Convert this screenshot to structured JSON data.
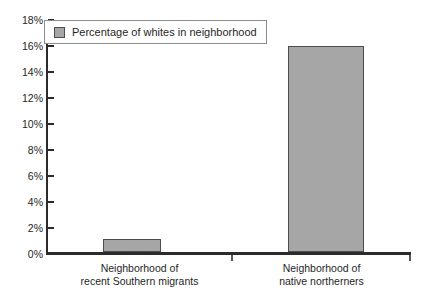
{
  "chart_data": {
    "type": "bar",
    "title": "",
    "subtitle": "",
    "xlabel": "",
    "ylabel": "",
    "categories": [
      "Neighborhood of recent Southern migrants",
      "Neighborhood of native northerners"
    ],
    "category_lines": [
      [
        "Neighborhood of",
        "recent Southern migrants"
      ],
      [
        "Neighborhood of",
        "native northerners"
      ]
    ],
    "series": [
      {
        "name": "Percentage of whites in neighborhood",
        "values": [
          1,
          16
        ]
      }
    ],
    "values": [
      1,
      16
    ],
    "ylim": [
      0,
      18
    ],
    "ytick_values": [
      18,
      16,
      14,
      12,
      10,
      8,
      6,
      4,
      2,
      0
    ],
    "ytick_labels": [
      "18%",
      "16%",
      "14%",
      "12%",
      "10%",
      "8%",
      "6%",
      "4%",
      "2%",
      "0%"
    ],
    "grid": false,
    "legend": {
      "position": "top-left-inside",
      "entries": [
        {
          "label": "Percentage of whites in neighborhood",
          "color": "#a6a6a6"
        }
      ]
    },
    "colors": {
      "bar_fill": "#a6a6a6",
      "bar_edge": "#4d4d4d",
      "axis": "#2b2b2b",
      "text": "#1f1f1f",
      "background": "#ffffff"
    }
  }
}
